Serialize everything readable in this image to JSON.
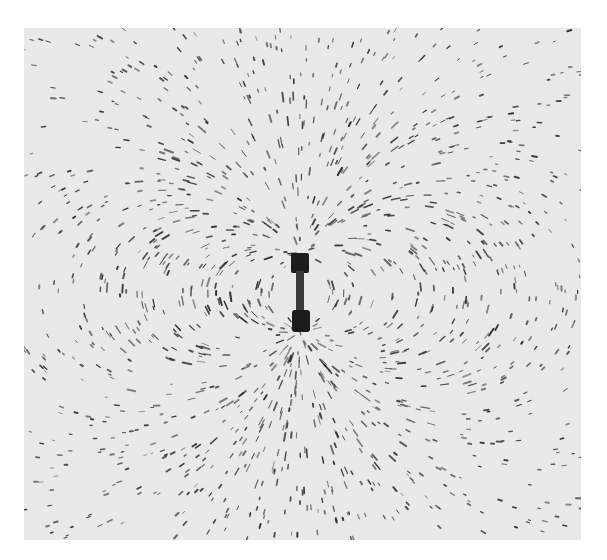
{
  "image": {
    "subject": "Iron filings aligned around a small bar magnet, showing a dipole magnetic field pattern",
    "style": "black-and-white photograph",
    "background_color": "#ffffff",
    "paper_color": "#e9e9e9",
    "filing_color": "#2a2a2a",
    "magnet_color": "#1c1c1c"
  },
  "photo": {
    "x": 24,
    "y": 28,
    "width": 557,
    "height": 512
  },
  "magnet": {
    "cx": 300,
    "top": 253,
    "bottom": 332,
    "width": 18
  },
  "field": {
    "filings": 2600,
    "seed": 7
  }
}
